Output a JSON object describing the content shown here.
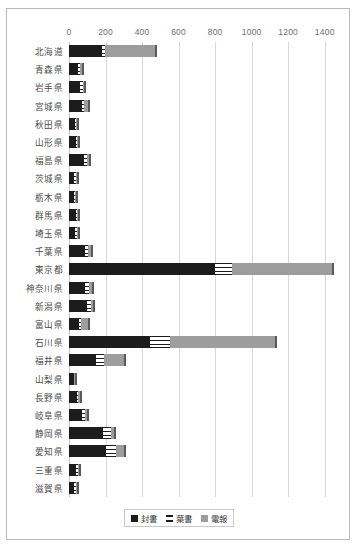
{
  "chart_data": {
    "type": "bar",
    "orientation": "horizontal",
    "stacked": true,
    "title": "",
    "subtitle": "",
    "xlabel": "",
    "ylabel": "",
    "xlim": [
      0,
      1500
    ],
    "xticks": [
      0,
      200,
      400,
      600,
      800,
      1000,
      1200,
      1400
    ],
    "xtick_labels": [
      "0",
      "200",
      "400",
      "600",
      "800",
      "1000",
      "1200",
      "1400"
    ],
    "grid": true,
    "legend_position": "bottom",
    "categories": [
      "北海道",
      "青森県",
      "岩手県",
      "宮城県",
      "秋田県",
      "山形県",
      "福島県",
      "茨城県",
      "栃木県",
      "群馬県",
      "埼玉県",
      "千葉県",
      "東京都",
      "神奈川県",
      "新潟県",
      "富山県",
      "石川県",
      "福井県",
      "山梨県",
      "長野県",
      "岐阜県",
      "静岡県",
      "愛知県",
      "三重県",
      "滋賀県"
    ],
    "series": [
      {
        "name": "封書",
        "color": "#1c1c1c",
        "values": [
          180,
          50,
          60,
          70,
          32,
          36,
          80,
          30,
          28,
          38,
          34,
          85,
          800,
          90,
          100,
          55,
          445,
          150,
          25,
          42,
          70,
          185,
          205,
          38,
          30
        ]
      },
      {
        "name": "葉書",
        "color": "#ffffff",
        "values": [
          18,
          12,
          14,
          10,
          8,
          8,
          16,
          8,
          6,
          8,
          8,
          20,
          90,
          18,
          18,
          10,
          110,
          40,
          5,
          10,
          18,
          45,
          55,
          10,
          8
        ]
      },
      {
        "name": "電報",
        "color": "#9d9d9d",
        "values": [
          272,
          10,
          8,
          22,
          4,
          8,
          14,
          4,
          4,
          6,
          6,
          14,
          550,
          16,
          12,
          38,
          575,
          110,
          3,
          6,
          10,
          18,
          40,
          6,
          4
        ]
      }
    ]
  },
  "legend": {
    "items": [
      {
        "label": "封書",
        "swatch": "black-square-icon"
      },
      {
        "label": "葉書",
        "swatch": "striped-square-icon"
      },
      {
        "label": "電報",
        "swatch": "gray-square-icon"
      }
    ]
  }
}
